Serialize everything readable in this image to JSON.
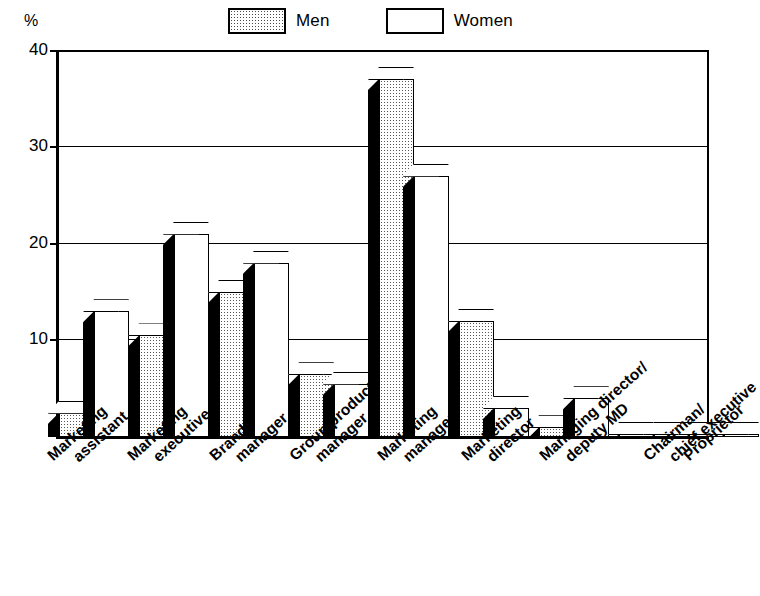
{
  "axis": {
    "unit_label": "%",
    "y_ticks": [
      "40",
      "30",
      "20",
      "10",
      "0"
    ],
    "y_min": 0,
    "y_max": 40
  },
  "legend": {
    "items": [
      {
        "label": "Men",
        "swatch": "men-swatch-stippled"
      },
      {
        "label": "Women",
        "swatch": "women-swatch-white"
      }
    ]
  },
  "chart_data": {
    "type": "bar",
    "title": "",
    "subtitle": "",
    "xlabel": "",
    "ylabel": "%",
    "ylim": [
      0,
      40
    ],
    "yticks": [
      0,
      10,
      20,
      30,
      40
    ],
    "grid": true,
    "legend_position": "top",
    "style": "3d-grouped-bar",
    "categories": [
      "Marketing assistant",
      "Marketing executive",
      "Brand manager",
      "Group product manager",
      "Marketing manager",
      "Marketing director",
      "Managing director/ deputy MD",
      "Chairman/ chief executive",
      "Proprietor"
    ],
    "category_lines": [
      [
        "Marketing",
        "assistant"
      ],
      [
        "Marketing",
        "executive"
      ],
      [
        "Brand",
        "manager"
      ],
      [
        "Group product",
        "manager"
      ],
      [
        "Marketing",
        "manager"
      ],
      [
        "Marketing",
        "director"
      ],
      [
        "Managing director/",
        "deputy MD"
      ],
      [
        "Chairman/",
        "chief executive"
      ],
      [
        "Proprietor",
        ""
      ]
    ],
    "series": [
      {
        "name": "Men",
        "values": [
          2.5,
          10.5,
          15,
          6.5,
          37,
          12,
          1,
          0.3,
          0.3
        ]
      },
      {
        "name": "Women",
        "values": [
          13,
          21,
          18,
          5.5,
          27,
          3,
          4,
          0.3,
          0.3
        ]
      }
    ]
  }
}
